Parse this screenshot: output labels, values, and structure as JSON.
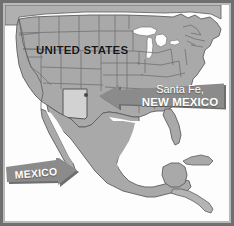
{
  "figure": {
    "kind": "reference-map",
    "title_visible": false,
    "frame_color": "#6f6f6f",
    "frame_inner_color": "#b9b9b9",
    "background_color": "#ffffff"
  },
  "map": {
    "ocean_color": "#fdfdfd",
    "land_color": "#a9a9a9",
    "land_border_color": "#5d5d5d",
    "state_border_color": "#6b6b6b",
    "highlight_color": "#d2d2d2",
    "lake_color": "#fdfdfd",
    "region": "North America"
  },
  "labels": {
    "united_states": "UNITED STATES",
    "mexico": "MEXICO"
  },
  "callouts": {
    "santa_fe": {
      "line_1": "Santa Fe,",
      "line_2": "NEW MEXICO",
      "banner_color": "#8b8b8b",
      "banner_shadow_color": "#6e6e6e",
      "text_color": "#ffffff",
      "arrow_direction": "left",
      "points_to": "Santa Fe"
    },
    "mexico": {
      "text": "MEXICO",
      "banner_color": "#8b8b8b",
      "banner_shadow_color": "#6e6e6e",
      "text_color": "#ffffff",
      "arrow_direction": "right",
      "points_to": "Mexico"
    }
  },
  "markers": {
    "santa_fe": {
      "name": "Santa Fe",
      "color": "#4a4a4a",
      "shape": "dot"
    }
  },
  "highlighted_state": {
    "name": "New Mexico",
    "fill": "#d2d2d2"
  }
}
